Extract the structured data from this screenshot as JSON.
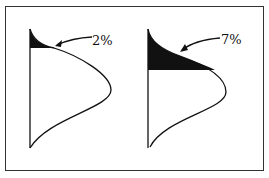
{
  "figure": {
    "panels": [
      {
        "label": "2%",
        "shaded_fraction": "small upper tail"
      },
      {
        "label": "7%",
        "shaded_fraction": "larger upper tail"
      }
    ]
  },
  "colors": {
    "ink": "#111111",
    "frame": "#333333",
    "background": "#ffffff"
  }
}
